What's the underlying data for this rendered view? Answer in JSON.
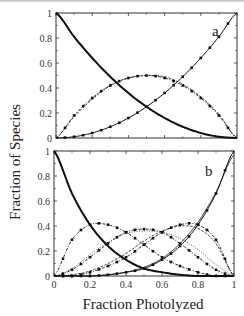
{
  "figure": {
    "ylabel": "Fraction of Species",
    "xlabel": "Fraction Photolyzed"
  },
  "chart_data": [
    {
      "type": "line",
      "panel": "a",
      "title": "",
      "xlabel": "Fraction Photolyzed",
      "ylabel": "Fraction of Species",
      "xlim": [
        0,
        1
      ],
      "ylim": [
        0,
        1
      ],
      "xticks": [
        "0",
        "0.2",
        "0.4",
        "0.6",
        "0.8",
        "1"
      ],
      "yticks": [
        "0",
        "0.2",
        "0.4",
        "0.6",
        "0.8",
        "1"
      ],
      "show_xtick_labels": false,
      "grid": false,
      "x": [
        0,
        0.1,
        0.2,
        0.3,
        0.4,
        0.5,
        0.6,
        0.7,
        0.8,
        0.9,
        1.0
      ],
      "series": [
        {
          "name": "unphotolyzed",
          "style": "dotted",
          "values": [
            1.0,
            0.81,
            0.64,
            0.49,
            0.36,
            0.25,
            0.16,
            0.09,
            0.04,
            0.01,
            0.0
          ]
        },
        {
          "name": "mono-photolyzed",
          "style": "dash-dot-markers",
          "values": [
            0.0,
            0.18,
            0.32,
            0.42,
            0.48,
            0.5,
            0.48,
            0.42,
            0.32,
            0.18,
            0.0
          ]
        },
        {
          "name": "mono-photolyzed (alt)",
          "style": "dashed",
          "values": [
            0.0,
            0.17,
            0.31,
            0.42,
            0.48,
            0.5,
            0.49,
            0.43,
            0.33,
            0.19,
            0.0
          ]
        },
        {
          "name": "fully photolyzed",
          "style": "solid-markers",
          "values": [
            0.0,
            0.01,
            0.04,
            0.09,
            0.16,
            0.25,
            0.36,
            0.49,
            0.64,
            0.81,
            1.0
          ]
        },
        {
          "name": "unphotolyzed (thick)",
          "style": "solid-thick",
          "values": [
            1.0,
            0.81,
            0.64,
            0.49,
            0.36,
            0.25,
            0.16,
            0.09,
            0.04,
            0.01,
            0.0
          ]
        }
      ],
      "annotations": [
        {
          "text": "a",
          "x": 0.88,
          "y": 0.86
        }
      ]
    },
    {
      "type": "line",
      "panel": "b",
      "title": "",
      "xlabel": "Fraction Photolyzed",
      "ylabel": "Fraction of Species",
      "xlim": [
        0,
        1
      ],
      "ylim": [
        0,
        1
      ],
      "xticks": [
        "0",
        "0.2",
        "0.4",
        "0.6",
        "0.8",
        "1"
      ],
      "yticks": [
        "0",
        "0.2",
        "0.4",
        "0.6",
        "0.8",
        "1"
      ],
      "show_xtick_labels": true,
      "grid": false,
      "x": [
        0,
        0.1,
        0.2,
        0.3,
        0.4,
        0.5,
        0.6,
        0.7,
        0.8,
        0.9,
        1.0
      ],
      "series": [
        {
          "name": "0 photolyzed",
          "style": "dotted",
          "values": [
            1.0,
            0.66,
            0.41,
            0.24,
            0.13,
            0.06,
            0.03,
            0.01,
            0.0,
            0.0,
            0.0
          ]
        },
        {
          "name": "0 photolyzed (thick)",
          "style": "solid-thick",
          "values": [
            1.0,
            0.66,
            0.41,
            0.24,
            0.13,
            0.06,
            0.03,
            0.01,
            0.0,
            0.0,
            0.0
          ]
        },
        {
          "name": "1 photolyzed",
          "style": "dash-dot-markers",
          "values": [
            0.0,
            0.29,
            0.41,
            0.41,
            0.35,
            0.25,
            0.15,
            0.08,
            0.03,
            0.0,
            0.0
          ]
        },
        {
          "name": "2 photolyzed",
          "style": "dash-dot-markers",
          "values": [
            0.0,
            0.05,
            0.15,
            0.26,
            0.35,
            0.375,
            0.35,
            0.26,
            0.15,
            0.05,
            0.0
          ]
        },
        {
          "name": "2 photolyzed (alt)",
          "style": "dotted-thin",
          "values": [
            0.0,
            0.06,
            0.17,
            0.27,
            0.34,
            0.36,
            0.35,
            0.3,
            0.21,
            0.09,
            0.0
          ]
        },
        {
          "name": "3 photolyzed",
          "style": "dash-dot-markers",
          "values": [
            0.0,
            0.0,
            0.03,
            0.08,
            0.15,
            0.25,
            0.35,
            0.41,
            0.41,
            0.29,
            0.0
          ]
        },
        {
          "name": "3 photolyzed (alt)",
          "style": "dashed",
          "values": [
            0.0,
            0.01,
            0.04,
            0.1,
            0.18,
            0.28,
            0.36,
            0.4,
            0.38,
            0.26,
            0.0
          ]
        },
        {
          "name": "4 photolyzed",
          "style": "solid-markers",
          "values": [
            0.0,
            0.0,
            0.0,
            0.01,
            0.03,
            0.06,
            0.13,
            0.24,
            0.41,
            0.66,
            1.0
          ]
        },
        {
          "name": "4 photolyzed (alt)",
          "style": "solid",
          "values": [
            0.0,
            0.0,
            0.0,
            0.01,
            0.03,
            0.07,
            0.14,
            0.26,
            0.43,
            0.67,
            0.97
          ]
        }
      ],
      "annotations": [
        {
          "text": "b",
          "x": 0.86,
          "y": 0.84
        }
      ]
    }
  ]
}
